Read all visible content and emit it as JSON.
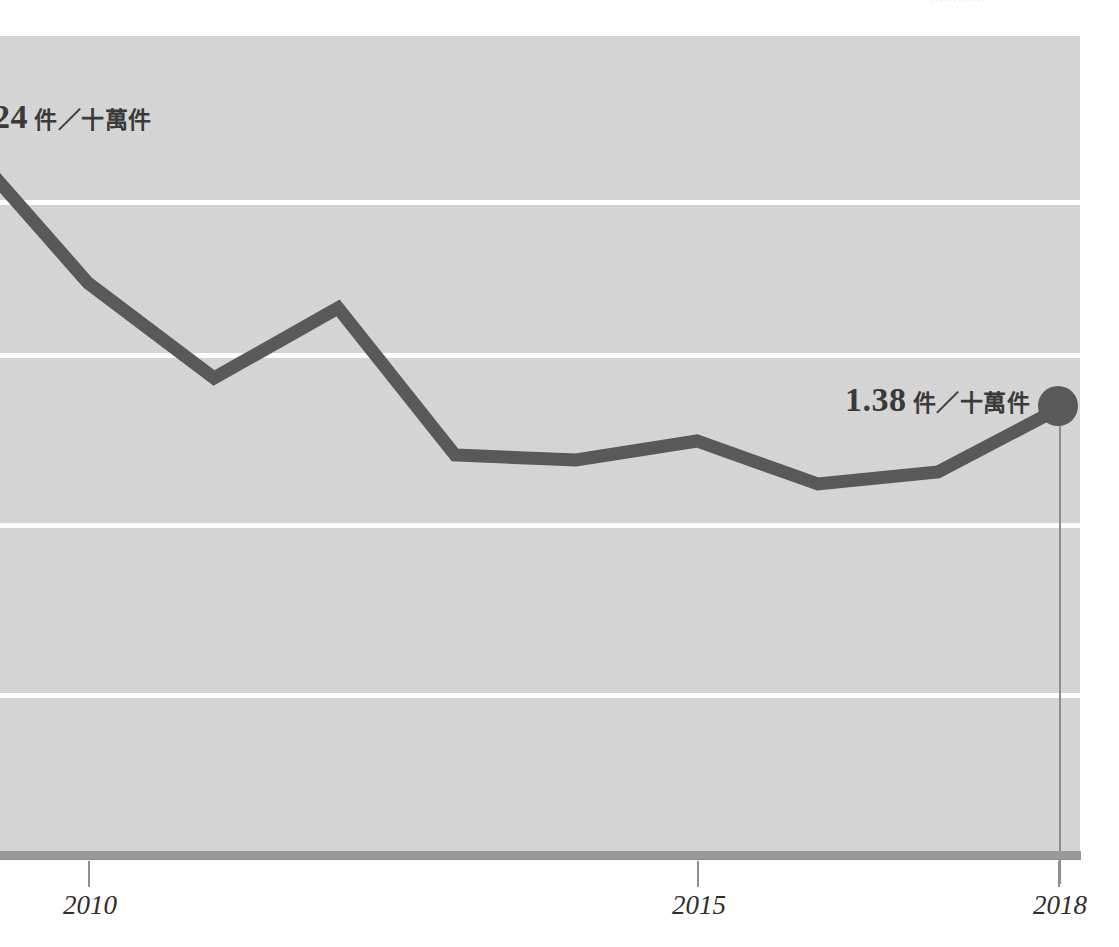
{
  "page": {
    "top_cut_text": "············"
  },
  "colors": {
    "plot_background": "#d6d6d6",
    "gridline": "#ffffff",
    "series_line": "#595959",
    "axis_bar": "#9a9a9a",
    "text": "#3a3a3a",
    "page_background": "#ffffff"
  },
  "callouts": {
    "start": {
      "number": ".24",
      "unit": "件／十萬件"
    },
    "end": {
      "number": "1.38",
      "unit": "件／十萬件"
    }
  },
  "axis": {
    "x_ticks": [
      {
        "label": "2010",
        "x": 88
      },
      {
        "label": "2015",
        "x": 697
      },
      {
        "label": "2018",
        "x": 1058
      }
    ]
  },
  "chart_data": {
    "type": "line",
    "title": "",
    "subtitle": "",
    "xlabel": "",
    "ylabel": "件／十萬件",
    "unit": "件／十萬件",
    "legend": [],
    "legend_position": "none",
    "grid": true,
    "gridlines_y_px": [
      202,
      355,
      525,
      695
    ],
    "xlim": [
      2009,
      2018
    ],
    "ylim": [
      0.6,
      2.6
    ],
    "x_tick_labels": [
      "2010",
      "2015",
      "2018"
    ],
    "annotations": [
      {
        "text": ".24 件／十萬件",
        "attaches_to": "first-visible-point",
        "note": "value cut off at left page edge"
      },
      {
        "text": "1.38 件／十萬件",
        "attaches_to": "2018",
        "note": "end point marker"
      }
    ],
    "series": [
      {
        "name": "件數／十萬件",
        "x": [
          2009,
          2010,
          2011,
          2012,
          2013,
          2014,
          2015,
          2016,
          2017,
          2018
        ],
        "values": [
          2.24,
          1.95,
          1.72,
          1.89,
          1.53,
          1.52,
          1.57,
          1.46,
          1.49,
          1.38
        ],
        "points_px": [
          {
            "x": -20,
            "y": 160
          },
          {
            "x": 88,
            "y": 283
          },
          {
            "x": 214,
            "y": 378
          },
          {
            "x": 338,
            "y": 308
          },
          {
            "x": 455,
            "y": 455
          },
          {
            "x": 576,
            "y": 460
          },
          {
            "x": 697,
            "y": 441
          },
          {
            "x": 818,
            "y": 484
          },
          {
            "x": 938,
            "y": 472
          },
          {
            "x": 1058,
            "y": 409
          }
        ],
        "marker_last": true
      }
    ]
  }
}
